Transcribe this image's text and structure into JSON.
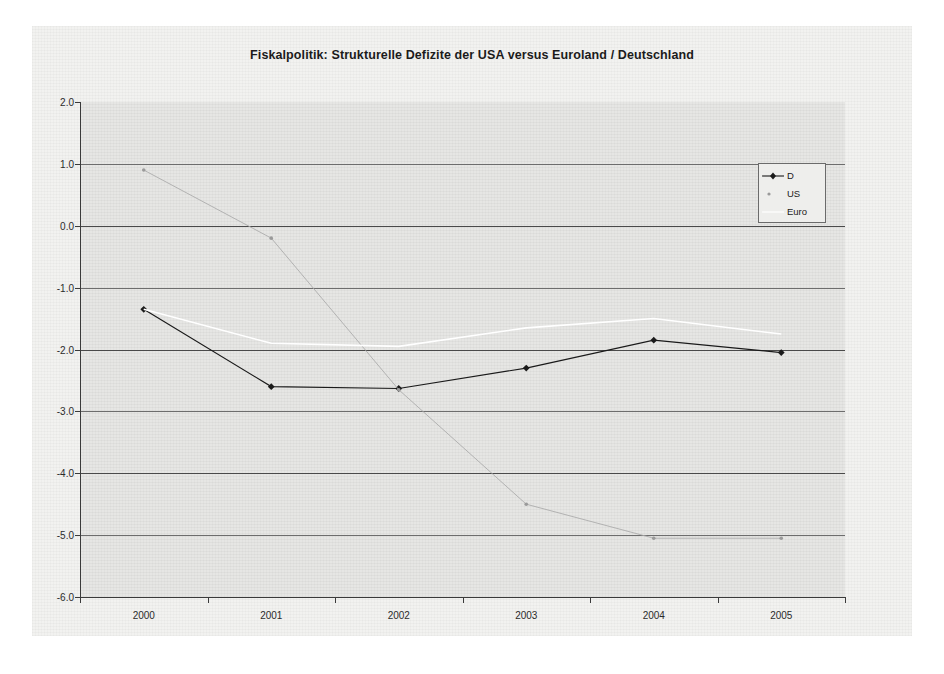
{
  "chart_data": {
    "type": "line",
    "title": "Fiskalpolitik: Strukturelle Defizite der USA versus Euroland / Deutschland",
    "xlabel": "",
    "ylabel": "",
    "categories": [
      "2000",
      "2001",
      "2002",
      "2003",
      "2004",
      "2005"
    ],
    "x": [
      2000,
      2001,
      2002,
      2003,
      2004,
      2005
    ],
    "ylim": [
      -6.0,
      2.0
    ],
    "yticks": [
      "2.0",
      "1.0",
      "0.0",
      "-1.0",
      "-2.0",
      "-3.0",
      "-4.0",
      "-5.0",
      "-6.0"
    ],
    "ytick_values": [
      2.0,
      1.0,
      0.0,
      -1.0,
      -2.0,
      -3.0,
      -4.0,
      -5.0,
      -6.0
    ],
    "grid": true,
    "legend_position": "top-right",
    "series": [
      {
        "name": "D",
        "color": "#1a1a1a",
        "marker": "filled-diamond",
        "values": [
          -1.35,
          -2.6,
          -2.63,
          -2.3,
          -1.85,
          -2.05
        ]
      },
      {
        "name": "US",
        "color": "#a9a9a9",
        "marker": "small-dot",
        "values": [
          0.9,
          -0.2,
          -2.65,
          -4.5,
          -5.05,
          -5.05
        ]
      },
      {
        "name": "Euro",
        "color": "#ffffff",
        "marker": "none",
        "values": [
          -1.35,
          -1.9,
          -1.95,
          -1.65,
          -1.5,
          -1.75
        ]
      }
    ]
  },
  "legend": {
    "entries": [
      {
        "label": "D"
      },
      {
        "label": "US"
      },
      {
        "label": "Euro"
      }
    ]
  }
}
